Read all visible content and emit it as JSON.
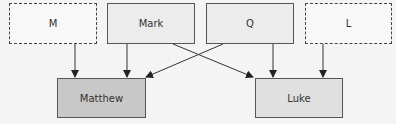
{
  "diagram": {
    "type": "source-dependency",
    "colors": {
      "background": "#f4f4f4",
      "hypothetical_fill": "#f8f8f8",
      "source_fill": "#ececec",
      "matthew_fill": "#c8c8c8",
      "luke_fill": "#e0e0e0",
      "line": "#333333"
    },
    "top_nodes": [
      {
        "id": "M",
        "label": "M",
        "style": "dashed"
      },
      {
        "id": "Mark",
        "label": "Mark",
        "style": "solid"
      },
      {
        "id": "Q",
        "label": "Q",
        "style": "solid"
      },
      {
        "id": "L",
        "label": "L",
        "style": "dashed"
      }
    ],
    "bottom_nodes": [
      {
        "id": "Matthew",
        "label": "Matthew"
      },
      {
        "id": "Luke",
        "label": "Luke"
      }
    ],
    "edges": [
      {
        "from": "M",
        "to": "Matthew"
      },
      {
        "from": "Mark",
        "to": "Matthew"
      },
      {
        "from": "Mark",
        "to": "Luke"
      },
      {
        "from": "Q",
        "to": "Matthew"
      },
      {
        "from": "Q",
        "to": "Luke"
      },
      {
        "from": "L",
        "to": "Luke"
      }
    ]
  }
}
